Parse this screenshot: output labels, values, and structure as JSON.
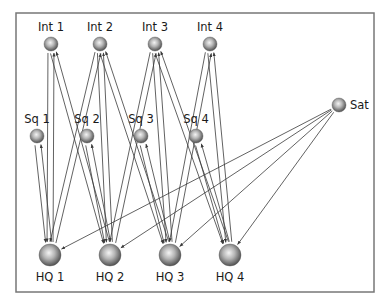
{
  "diagram": {
    "frame": {
      "x": 16,
      "y": 13,
      "width": 358,
      "height": 279,
      "stroke": "#777777"
    },
    "colors": {
      "edge": "#3a3a3a",
      "node_light": "#f2f2f2",
      "node_dark": "#4a4a4a"
    },
    "nodes": [
      {
        "id": "int1",
        "label": "Int 1",
        "x": 51,
        "y": 44,
        "r": 7,
        "label_pos": "top"
      },
      {
        "id": "int2",
        "label": "Int 2",
        "x": 100,
        "y": 44,
        "r": 7,
        "label_pos": "top"
      },
      {
        "id": "int3",
        "label": "Int 3",
        "x": 155,
        "y": 44,
        "r": 7,
        "label_pos": "top"
      },
      {
        "id": "int4",
        "label": "Int 4",
        "x": 210,
        "y": 44,
        "r": 7,
        "label_pos": "top"
      },
      {
        "id": "sq1",
        "label": "Sq 1",
        "x": 37,
        "y": 136,
        "r": 7,
        "label_pos": "top"
      },
      {
        "id": "sq2",
        "label": "Sq 2",
        "x": 87,
        "y": 136,
        "r": 7,
        "label_pos": "top"
      },
      {
        "id": "sq3",
        "label": "Sq 3",
        "x": 141,
        "y": 136,
        "r": 7,
        "label_pos": "top"
      },
      {
        "id": "sq4",
        "label": "Sq 4",
        "x": 196,
        "y": 136,
        "r": 7,
        "label_pos": "top"
      },
      {
        "id": "sat",
        "label": "Sat",
        "x": 339,
        "y": 105,
        "r": 7,
        "label_pos": "right"
      },
      {
        "id": "hq1",
        "label": "HQ 1",
        "x": 50,
        "y": 255,
        "r": 11,
        "label_pos": "bottom"
      },
      {
        "id": "hq2",
        "label": "HQ 2",
        "x": 110,
        "y": 255,
        "r": 11,
        "label_pos": "bottom"
      },
      {
        "id": "hq3",
        "label": "HQ 3",
        "x": 170,
        "y": 255,
        "r": 11,
        "label_pos": "bottom"
      },
      {
        "id": "hq4",
        "label": "HQ 4",
        "x": 230,
        "y": 255,
        "r": 11,
        "label_pos": "bottom"
      }
    ],
    "edges": [
      {
        "from": "hq1",
        "to": "sq1",
        "bidirectional": true
      },
      {
        "from": "hq2",
        "to": "sq2",
        "bidirectional": true
      },
      {
        "from": "hq3",
        "to": "sq3",
        "bidirectional": true
      },
      {
        "from": "hq4",
        "to": "sq4",
        "bidirectional": true
      },
      {
        "from": "hq1",
        "to": "int1",
        "bidirectional": true
      },
      {
        "from": "hq2",
        "to": "int2",
        "bidirectional": true
      },
      {
        "from": "hq3",
        "to": "int3",
        "bidirectional": true
      },
      {
        "from": "hq4",
        "to": "int4",
        "bidirectional": true
      },
      {
        "from": "hq1",
        "to": "int2",
        "bidirectional": true
      },
      {
        "from": "hq2",
        "to": "int1",
        "bidirectional": true
      },
      {
        "from": "hq2",
        "to": "int3",
        "bidirectional": true
      },
      {
        "from": "hq3",
        "to": "int2",
        "bidirectional": true
      },
      {
        "from": "hq3",
        "to": "int4",
        "bidirectional": true
      },
      {
        "from": "hq4",
        "to": "int3",
        "bidirectional": true
      },
      {
        "from": "sat",
        "to": "hq1",
        "bidirectional": false
      },
      {
        "from": "sat",
        "to": "hq2",
        "bidirectional": false
      },
      {
        "from": "sat",
        "to": "hq3",
        "bidirectional": false
      },
      {
        "from": "sat",
        "to": "hq4",
        "bidirectional": false
      }
    ]
  }
}
